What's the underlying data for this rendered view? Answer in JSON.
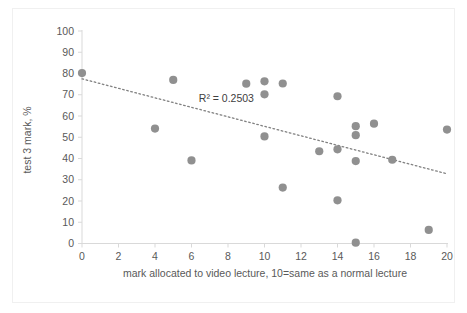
{
  "chart_data": {
    "type": "scatter",
    "title": "",
    "xlabel": "mark allocated to video lecture, 10=same as a normal lecture",
    "ylabel": "test 3 mark, %",
    "xlim": [
      0,
      20
    ],
    "ylim": [
      0,
      100
    ],
    "xticks": [
      0,
      2,
      4,
      6,
      8,
      10,
      12,
      14,
      16,
      18,
      20
    ],
    "xtick_labels": [
      "0",
      "2",
      "4",
      "6",
      "8",
      "10",
      "12",
      "14",
      "16",
      "18",
      "20"
    ],
    "yticks": [
      0,
      10,
      20,
      30,
      40,
      50,
      60,
      70,
      80,
      90,
      100
    ],
    "ytick_labels": [
      "0",
      "10",
      "20",
      "30",
      "40",
      "50",
      "60",
      "70",
      "80",
      "90",
      "100"
    ],
    "grid": false,
    "legend": false,
    "point_color": "#909090",
    "trend_color": "#808080",
    "annotations": [
      {
        "text": "R² = 0.2503",
        "x": 6.4,
        "y": 66.5
      }
    ],
    "trendline": {
      "style": "dotted",
      "x_start": 0,
      "y_start": 77.5,
      "x_end": 20,
      "y_end": 32.8,
      "r_squared": 0.2503,
      "equation_label": "R² = 0.2503"
    },
    "points": [
      {
        "x": 0,
        "y": 80.2
      },
      {
        "x": 4,
        "y": 54.1
      },
      {
        "x": 5,
        "y": 77.0
      },
      {
        "x": 6,
        "y": 39.1
      },
      {
        "x": 9,
        "y": 75.2
      },
      {
        "x": 10,
        "y": 76.3
      },
      {
        "x": 10,
        "y": 70.2
      },
      {
        "x": 10,
        "y": 50.4
      },
      {
        "x": 11,
        "y": 75.3
      },
      {
        "x": 11,
        "y": 26.3
      },
      {
        "x": 13,
        "y": 43.4
      },
      {
        "x": 14,
        "y": 69.3
      },
      {
        "x": 14,
        "y": 44.3
      },
      {
        "x": 14,
        "y": 20.3
      },
      {
        "x": 15,
        "y": 55.2
      },
      {
        "x": 15,
        "y": 51.0
      },
      {
        "x": 15,
        "y": 38.8
      },
      {
        "x": 15,
        "y": 0.4
      },
      {
        "x": 16,
        "y": 56.4
      },
      {
        "x": 17,
        "y": 39.4
      },
      {
        "x": 19,
        "y": 6.4
      },
      {
        "x": 20,
        "y": 53.6
      }
    ]
  }
}
